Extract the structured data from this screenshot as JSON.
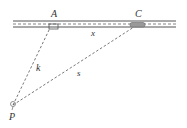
{
  "diagram": {
    "type": "geometry-road-triangle",
    "labels": {
      "A": "A",
      "C": "C",
      "P": "P",
      "x": "x",
      "k": "k",
      "s": "s"
    },
    "colors": {
      "line": "#555555",
      "label": "#333333",
      "car": "#888888"
    }
  }
}
